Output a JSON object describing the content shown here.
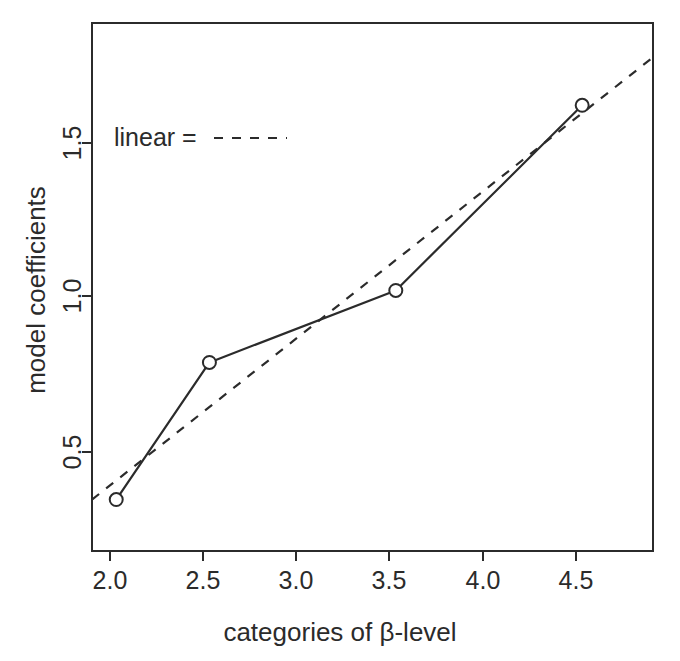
{
  "figure": {
    "background_color": "#ffffff",
    "ink_color": "#2b2b2b"
  },
  "chart_data": {
    "type": "line",
    "title": "",
    "subtitle": "",
    "xlabel": "categories of β-level",
    "ylabel": "model coefficients",
    "grid": false,
    "box_frame": true,
    "xlim": [
      1.87,
      4.88
    ],
    "ylim": [
      0.28,
      1.82
    ],
    "xticks": [
      2.0,
      2.5,
      3.0,
      3.5,
      4.0,
      4.5
    ],
    "xtick_labels": [
      "2.0",
      "2.5",
      "3.0",
      "3.5",
      "4.0",
      "4.5"
    ],
    "yticks": [
      0.5,
      1.0,
      1.5
    ],
    "ytick_labels": [
      "0.5",
      "1.0",
      "1.5"
    ],
    "x": [
      2.0,
      2.5,
      3.5,
      4.5
    ],
    "series": [
      {
        "name": "model coefficients",
        "style": "solid-with-open-circles",
        "values": [
          0.43,
          0.83,
          1.04,
          1.58
        ]
      },
      {
        "name": "linear",
        "style": "dashed",
        "x_endpoints": [
          1.87,
          4.88
        ],
        "y_endpoints": [
          0.43,
          1.72
        ]
      }
    ],
    "legend": {
      "position": "top-left-inside",
      "entries": [
        {
          "label": "linear =",
          "style": "dashed"
        }
      ]
    }
  },
  "axis_labels": {
    "y_title": "model coefficients",
    "x_title": "categories of β-level"
  },
  "legend": {
    "linear_label": "linear ="
  },
  "x_tick_labels": {
    "t0": "2.0",
    "t1": "2.5",
    "t2": "3.0",
    "t3": "3.5",
    "t4": "4.0",
    "t5": "4.5"
  },
  "y_tick_labels": {
    "t0": "0.5",
    "t1": "1.0",
    "t2": "1.5"
  }
}
